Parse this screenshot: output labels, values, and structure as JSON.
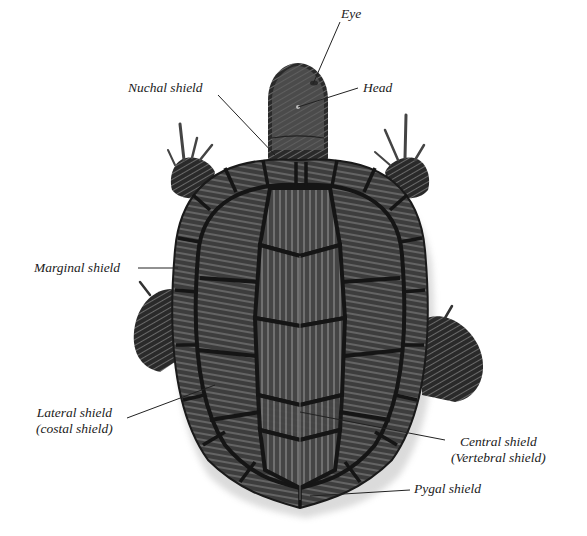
{
  "figure": {
    "background": "#ffffff",
    "shell_color": "#3c3c3c",
    "seam_color": "#151515",
    "stripe_color": "#8a8a8a",
    "line_color": "#222222"
  },
  "labels": {
    "eye": "Eye",
    "head": "Head",
    "nuchal": "Nuchal shield",
    "marginal": "Marginal shield",
    "lateral_1": "Lateral shield",
    "lateral_2": "(costal shield)",
    "central_1": "Central shield",
    "central_2": "(Vertebral shield)",
    "pygal": "Pygal shield"
  }
}
